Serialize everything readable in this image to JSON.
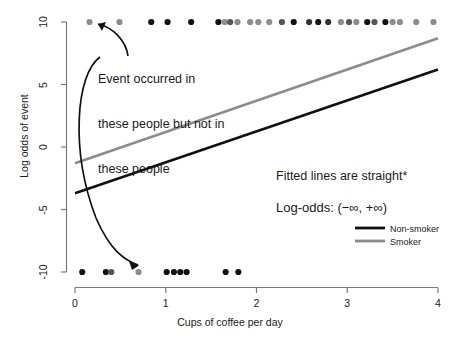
{
  "chart_data": {
    "type": "scatter",
    "title": "",
    "xlabel": "Cups of coffee per day",
    "ylabel": "Log odds of event",
    "xlim": [
      -0.1,
      4.15
    ],
    "ylim": [
      -11.0,
      11.0
    ],
    "xticks": [
      0,
      1,
      2,
      3,
      4
    ],
    "xtick_labels": [
      "0",
      "1",
      "2",
      "3",
      "4"
    ],
    "yticks": [
      10,
      5,
      0,
      -5,
      -10
    ],
    "ytick_labels": [
      "10",
      "5",
      "0",
      "-5",
      "-10"
    ],
    "grid": false,
    "legend_position": "right-middle",
    "series": [
      {
        "name": "Non-smoker",
        "type": "line",
        "color": "#111111",
        "x": [
          0,
          4
        ],
        "y": [
          -3.7,
          6.2
        ]
      },
      {
        "name": "Smoker",
        "type": "line",
        "color": "#8c8c8c",
        "x": [
          0,
          4
        ],
        "y": [
          -1.3,
          8.7
        ]
      },
      {
        "name": "Event occurred (y = 10)",
        "type": "scatter",
        "y_value": 10,
        "points": [
          {
            "x": 0.16,
            "c": "#8c8c8c"
          },
          {
            "x": 0.49,
            "c": "#8c8c8c"
          },
          {
            "x": 0.84,
            "c": "#111111"
          },
          {
            "x": 1.02,
            "c": "#111111"
          },
          {
            "x": 1.28,
            "c": "#111111"
          },
          {
            "x": 1.58,
            "c": "#111111"
          },
          {
            "x": 1.65,
            "c": "#8c8c8c"
          },
          {
            "x": 1.71,
            "c": "#555555"
          },
          {
            "x": 1.79,
            "c": "#8c8c8c"
          },
          {
            "x": 1.93,
            "c": "#8c8c8c"
          },
          {
            "x": 2.02,
            "c": "#8c8c8c"
          },
          {
            "x": 2.14,
            "c": "#8c8c8c"
          },
          {
            "x": 2.28,
            "c": "#555555"
          },
          {
            "x": 2.41,
            "c": "#111111"
          },
          {
            "x": 2.58,
            "c": "#333333"
          },
          {
            "x": 2.68,
            "c": "#111111"
          },
          {
            "x": 2.79,
            "c": "#333333"
          },
          {
            "x": 2.93,
            "c": "#8c8c8c"
          },
          {
            "x": 3.02,
            "c": "#555555"
          },
          {
            "x": 3.1,
            "c": "#8c8c8c"
          },
          {
            "x": 3.22,
            "c": "#111111"
          },
          {
            "x": 3.3,
            "c": "#555555"
          },
          {
            "x": 3.42,
            "c": "#111111"
          },
          {
            "x": 3.5,
            "c": "#8c8c8c"
          },
          {
            "x": 3.58,
            "c": "#8c8c8c"
          },
          {
            "x": 3.76,
            "c": "#8c8c8c"
          },
          {
            "x": 3.95,
            "c": "#8c8c8c"
          }
        ]
      },
      {
        "name": "Event did not occur (y = -10)",
        "y_value": -10,
        "type": "scatter",
        "points": [
          {
            "x": 0.08,
            "c": "#111111"
          },
          {
            "x": 0.34,
            "c": "#111111"
          },
          {
            "x": 0.4,
            "c": "#555555"
          },
          {
            "x": 0.7,
            "c": "#8c8c8c"
          },
          {
            "x": 1.01,
            "c": "#111111"
          },
          {
            "x": 1.09,
            "c": "#111111"
          },
          {
            "x": 1.16,
            "c": "#111111"
          },
          {
            "x": 1.23,
            "c": "#111111"
          },
          {
            "x": 1.66,
            "c": "#111111"
          },
          {
            "x": 1.8,
            "c": "#111111"
          }
        ]
      }
    ],
    "annotations": [
      {
        "name": "event-occurred-note",
        "text_lines": [
          "Event occurred in",
          "these people but not in",
          "these people"
        ],
        "x": 98,
        "y": 42
      },
      {
        "name": "fitted-lines-note",
        "text": "Fitted lines are straight*",
        "x": 276,
        "y": 169
      },
      {
        "name": "log-odds-range-note",
        "text": "Log-odds: (−∞, +∞)",
        "x": 276,
        "y": 200
      }
    ],
    "arrows": [
      {
        "name": "arrow-to-top-points",
        "from": [
          126,
          52
        ],
        "to": [
          96,
          25
        ]
      },
      {
        "name": "arrow-to-bottom-points",
        "from": [
          100,
          54
        ],
        "to": [
          140,
          266
        ]
      }
    ],
    "legend": {
      "entries": [
        {
          "label": "Non-smoker",
          "color": "#111111"
        },
        {
          "label": "Smoker",
          "color": "#8c8c8c"
        }
      ]
    }
  },
  "axis": {
    "x_label": "Cups of coffee per day",
    "y_label": "Log odds of event",
    "x_ticks": [
      "0",
      "1",
      "2",
      "3",
      "4"
    ],
    "y_ticks": [
      "10",
      "5",
      "0",
      "-5",
      "-10"
    ]
  },
  "text": {
    "ann_line1": "Event occurred in",
    "ann_line2": "these people but not in",
    "ann_line3": "these people",
    "fitted": "Fitted lines are straight*",
    "logodds": "Log-odds: (−∞, +∞)",
    "legend_nonsmoker": "Non-smoker",
    "legend_smoker": "Smoker"
  },
  "colors": {
    "nonsmoker": "#111111",
    "smoker": "#8c8c8c",
    "axis": "#7a7a7a",
    "background": "#ffffff"
  }
}
